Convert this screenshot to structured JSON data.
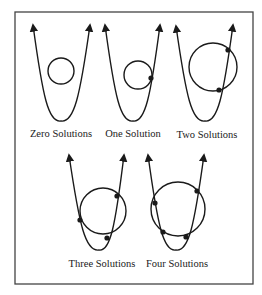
{
  "figure": {
    "frame": {
      "x": 15,
      "y": 12,
      "w": 238,
      "h": 272,
      "color": "#444444"
    },
    "stroke_color": "#1a1a1a",
    "panels": [
      {
        "id": "zero",
        "label": "Zero Solutions",
        "label_pos": [
          61,
          128
        ],
        "parabola": {
          "left_tip": [
            33,
            25
          ],
          "vertex": [
            61,
            121
          ],
          "right_tip": [
            90,
            25
          ]
        },
        "circle": {
          "cx": 61,
          "cy": 71,
          "r": 13
        },
        "intersections": []
      },
      {
        "id": "one",
        "label": "One Solution",
        "label_pos": [
          133,
          128
        ],
        "parabola": {
          "left_tip": [
            105,
            25
          ],
          "vertex": [
            133,
            121
          ],
          "right_tip": [
            160,
            25
          ]
        },
        "circle": {
          "cx": 138,
          "cy": 75,
          "r": 14
        },
        "intersections": [
          [
            151,
            78
          ]
        ]
      },
      {
        "id": "two",
        "label": "Two Solutions",
        "label_pos": [
          207,
          129
        ],
        "parabola": {
          "left_tip": [
            176,
            26
          ],
          "vertex": [
            205,
            121
          ],
          "right_tip": [
            233,
            25
          ]
        },
        "circle": {
          "cx": 213,
          "cy": 67,
          "r": 24
        },
        "intersections": [
          [
            228,
            50
          ],
          [
            219,
            90
          ]
        ]
      },
      {
        "id": "three",
        "label": "Three Solutions",
        "label_pos": [
          102,
          258
        ],
        "parabola": {
          "left_tip": [
            69,
            155
          ],
          "vertex": [
            99,
            250
          ],
          "right_tip": [
            124,
            155
          ]
        },
        "circle": {
          "cx": 103,
          "cy": 211,
          "r": 23
        },
        "intersections": [
          [
            80,
            220
          ],
          [
            117,
            196
          ],
          [
            107,
            238
          ]
        ]
      },
      {
        "id": "four",
        "label": "Four Solutions",
        "label_pos": [
          177,
          258
        ],
        "parabola": {
          "left_tip": [
            148,
            155
          ],
          "vertex": [
            176,
            250
          ],
          "right_tip": [
            204,
            155
          ]
        },
        "circle": {
          "cx": 178,
          "cy": 209,
          "r": 27
        },
        "intersections": [
          [
            155,
            203
          ],
          [
            197,
            191
          ],
          [
            163,
            232
          ],
          [
            186,
            237
          ]
        ]
      }
    ]
  }
}
